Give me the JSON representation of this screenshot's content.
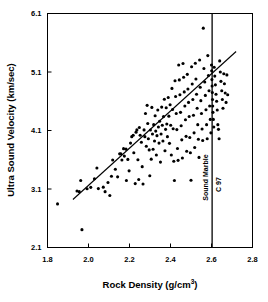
{
  "chart_data": {
    "type": "scatter",
    "title": "",
    "xlabel": "Rock Density (g/cm3)",
    "xlabel_base": "Rock Density (g/cm",
    "xlabel_sup": "3",
    "xlabel_tail": ")",
    "ylabel": "Ultra Sound Velocity (km/sec)",
    "xlim": [
      1.8,
      2.8
    ],
    "ylim": [
      2.1,
      6.1
    ],
    "xticks": [
      1.8,
      2.0,
      2.2,
      2.4,
      2.6,
      2.8
    ],
    "xtick_labels": [
      "1.8",
      "2.0",
      "2.2",
      "2.4",
      "2.6",
      "2.8"
    ],
    "yticks": [
      2.1,
      3.1,
      4.1,
      5.1,
      6.1
    ],
    "ytick_labels": [
      "2.1",
      "3.1",
      "4.1",
      "5.1",
      "6.1"
    ],
    "grid": false,
    "legend": false,
    "marker_color": "#000000",
    "marker_size": 3.1,
    "frame_color": "#000000",
    "annotations": [
      {
        "name": "sound-marble-label",
        "text": "Sound Marble",
        "x": 2.585,
        "y": 2.9,
        "orientation": "vertical"
      },
      {
        "name": "c97-label",
        "text": "C 97",
        "x": 2.645,
        "y": 3.05,
        "orientation": "vertical"
      }
    ],
    "reference_lines": [
      {
        "name": "sound-marble-vertical-line",
        "orientation": "vertical",
        "x": 2.603,
        "y_from": 2.1,
        "y_to": 6.1,
        "color": "#000000",
        "width": 1.3
      }
    ],
    "trend_line": {
      "name": "regression-trend-line",
      "x_from": 1.924,
      "y_from": 2.92,
      "x_to": 2.72,
      "y_to": 5.45,
      "color": "#000000",
      "width": 1.1
    },
    "series": [
      {
        "name": "rock samples",
        "points": [
          [
            1.849,
            2.845
          ],
          [
            1.944,
            3.065
          ],
          [
            1.955,
            3.055
          ],
          [
            1.968,
            2.405
          ],
          [
            1.962,
            3.245
          ],
          [
            1.993,
            3.105
          ],
          [
            2.011,
            3.128
          ],
          [
            2.029,
            3.275
          ],
          [
            2.041,
            3.458
          ],
          [
            2.048,
            3.107
          ],
          [
            2.072,
            3.132
          ],
          [
            2.081,
            3.055
          ],
          [
            2.095,
            3.212
          ],
          [
            2.104,
            2.988
          ],
          [
            2.112,
            3.318
          ],
          [
            2.118,
            3.595
          ],
          [
            2.131,
            3.438
          ],
          [
            2.142,
            3.308
          ],
          [
            2.152,
            3.701
          ],
          [
            2.158,
            3.702
          ],
          [
            2.163,
            3.596
          ],
          [
            2.171,
            3.79
          ],
          [
            2.175,
            3.662
          ],
          [
            2.183,
            3.781
          ],
          [
            2.185,
            3.245
          ],
          [
            2.192,
            3.606
          ],
          [
            2.198,
            3.41
          ],
          [
            2.205,
            3.885
          ],
          [
            2.211,
            3.995
          ],
          [
            2.218,
            4.02
          ],
          [
            2.221,
            3.72
          ],
          [
            2.228,
            3.192
          ],
          [
            2.232,
            4.072
          ],
          [
            2.236,
            4.11
          ],
          [
            2.241,
            3.6
          ],
          [
            2.245,
            3.262
          ],
          [
            2.248,
            4.152
          ],
          [
            2.252,
            4.018
          ],
          [
            2.258,
            3.9
          ],
          [
            2.262,
            3.482
          ],
          [
            2.266,
            3.185
          ],
          [
            2.271,
            4.11
          ],
          [
            2.275,
            3.995
          ],
          [
            2.278,
            4.39
          ],
          [
            2.282,
            3.832
          ],
          [
            2.286,
            4.53
          ],
          [
            2.289,
            4.22
          ],
          [
            2.292,
            3.958
          ],
          [
            2.296,
            3.768
          ],
          [
            2.299,
            3.326
          ],
          [
            2.302,
            4.108
          ],
          [
            2.306,
            3.61
          ],
          [
            2.309,
            4.495
          ],
          [
            2.312,
            4.04
          ],
          [
            2.315,
            3.78
          ],
          [
            2.318,
            4.2
          ],
          [
            2.322,
            3.92
          ],
          [
            2.325,
            4.352
          ],
          [
            2.328,
            4.09
          ],
          [
            2.331,
            3.68
          ],
          [
            2.334,
            4.012
          ],
          [
            2.338,
            4.45
          ],
          [
            2.341,
            4.16
          ],
          [
            2.344,
            3.885
          ],
          [
            2.347,
            4.258
          ],
          [
            2.351,
            3.56
          ],
          [
            2.354,
            4.04
          ],
          [
            2.357,
            4.5
          ],
          [
            2.36,
            4.19
          ],
          [
            2.363,
            3.92
          ],
          [
            2.366,
            4.338
          ],
          [
            2.37,
            4.635
          ],
          [
            2.373,
            3.755
          ],
          [
            2.376,
            4.12
          ],
          [
            2.379,
            4.49
          ],
          [
            2.382,
            4.21
          ],
          [
            2.385,
            3.995
          ],
          [
            2.389,
            4.665
          ],
          [
            2.392,
            4.345
          ],
          [
            2.395,
            3.88
          ],
          [
            2.398,
            4.54
          ],
          [
            2.401,
            4.19
          ],
          [
            2.404,
            3.68
          ],
          [
            2.407,
            4.82
          ],
          [
            2.41,
            4.46
          ],
          [
            2.413,
            4.13
          ],
          [
            2.416,
            3.575
          ],
          [
            2.419,
            3.245
          ],
          [
            2.422,
            4.95
          ],
          [
            2.425,
            4.68
          ],
          [
            2.428,
            4.39
          ],
          [
            2.431,
            4.115
          ],
          [
            2.434,
            3.792
          ],
          [
            2.437,
            3.59
          ],
          [
            2.44,
            5.22
          ],
          [
            2.443,
            4.965
          ],
          [
            2.446,
            4.71
          ],
          [
            2.449,
            4.41
          ],
          [
            2.452,
            4.18
          ],
          [
            2.455,
            3.94
          ],
          [
            2.458,
            3.63
          ],
          [
            2.461,
            5.245
          ],
          [
            2.464,
            5.01
          ],
          [
            2.467,
            4.76
          ],
          [
            2.47,
            4.52
          ],
          [
            2.473,
            4.285
          ],
          [
            2.476,
            4.0
          ],
          [
            2.479,
            3.745
          ],
          [
            2.482,
            5.06
          ],
          [
            2.485,
            4.81
          ],
          [
            2.488,
            4.58
          ],
          [
            2.491,
            4.34
          ],
          [
            2.494,
            3.98
          ],
          [
            2.497,
            3.72
          ],
          [
            2.5,
            3.25
          ],
          [
            2.503,
            5.19
          ],
          [
            2.506,
            4.895
          ],
          [
            2.509,
            4.63
          ],
          [
            2.512,
            4.36
          ],
          [
            2.515,
            4.06
          ],
          [
            2.518,
            3.81
          ],
          [
            2.521,
            5.25
          ],
          [
            2.524,
            4.98
          ],
          [
            2.527,
            4.72
          ],
          [
            2.53,
            4.48
          ],
          [
            2.533,
            4.2
          ],
          [
            2.536,
            3.95
          ],
          [
            2.539,
            3.64
          ],
          [
            2.542,
            5.305
          ],
          [
            2.545,
            4.84
          ],
          [
            2.548,
            4.61
          ],
          [
            2.551,
            4.39
          ],
          [
            2.554,
            4.125
          ],
          [
            2.557,
            3.93
          ],
          [
            2.56,
            5.85
          ],
          [
            2.563,
            5.16
          ],
          [
            2.567,
            4.93
          ],
          [
            2.57,
            4.7
          ],
          [
            2.573,
            4.455
          ],
          [
            2.576,
            4.2
          ],
          [
            2.579,
            3.96
          ],
          [
            2.582,
            5.38
          ],
          [
            2.585,
            5.04
          ],
          [
            2.588,
            4.78
          ],
          [
            2.591,
            4.52
          ],
          [
            2.594,
            4.29
          ],
          [
            2.597,
            4.06
          ],
          [
            2.6,
            5.22
          ],
          [
            2.601,
            5.12
          ],
          [
            2.602,
            4.97
          ],
          [
            2.603,
            4.86
          ],
          [
            2.604,
            4.75
          ],
          [
            2.605,
            4.63
          ],
          [
            2.606,
            4.52
          ],
          [
            2.607,
            4.41
          ],
          [
            2.609,
            4.29
          ],
          [
            2.611,
            4.16
          ],
          [
            2.613,
            5.18
          ],
          [
            2.616,
            5.03
          ],
          [
            2.619,
            4.88
          ],
          [
            2.622,
            4.72
          ],
          [
            2.625,
            4.6
          ],
          [
            2.628,
            4.45
          ],
          [
            2.631,
            4.2
          ],
          [
            2.634,
            4.12
          ],
          [
            2.637,
            3.96
          ],
          [
            2.64,
            5.29
          ],
          [
            2.643,
            5.1
          ],
          [
            2.646,
            4.94
          ],
          [
            2.65,
            4.78
          ],
          [
            2.653,
            4.63
          ],
          [
            2.656,
            4.48
          ],
          [
            2.66,
            5.07
          ],
          [
            2.663,
            4.9
          ],
          [
            2.667,
            4.74
          ],
          [
            2.671,
            4.58
          ],
          [
            2.675,
            5.05
          ],
          [
            2.679,
            4.71
          ]
        ]
      }
    ]
  }
}
